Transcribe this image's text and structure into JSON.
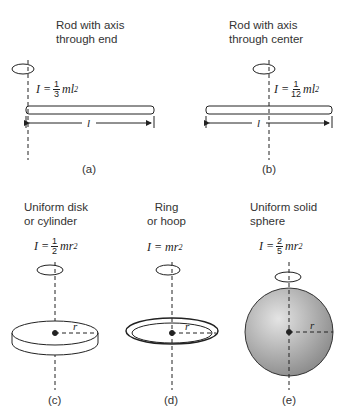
{
  "panels": [
    {
      "id": "a",
      "title_line1": "Rod with axis",
      "title_line2": "through end",
      "formula_lhs": "I =",
      "frac_num": "1",
      "frac_den": "3",
      "formula_rhs": "ml",
      "exp": "2",
      "length_label": "l",
      "caption": "(a)"
    },
    {
      "id": "b",
      "title_line1": "Rod with axis",
      "title_line2": "through center",
      "formula_lhs": "I =",
      "frac_num": "1",
      "frac_den": "12",
      "formula_rhs": "ml",
      "exp": "2",
      "length_label": "l",
      "caption": "(b)"
    },
    {
      "id": "c",
      "title_line1": "Uniform disk",
      "title_line2": "or cylinder",
      "formula_lhs": "I =",
      "frac_num": "1",
      "frac_den": "2",
      "formula_rhs": "mr",
      "exp": "2",
      "radius_label": "r",
      "caption": "(c)"
    },
    {
      "id": "d",
      "title_line1": "Ring",
      "title_line2": "or hoop",
      "formula_lhs": "I = mr",
      "exp": "2",
      "radius_label": "r",
      "caption": "(d)"
    },
    {
      "id": "e",
      "title_line1": "Uniform solid",
      "title_line2": "sphere",
      "formula_lhs": "I =",
      "frac_num": "2",
      "frac_den": "5",
      "formula_rhs": "mr",
      "exp": "2",
      "radius_label": "r",
      "caption": "(e)"
    }
  ],
  "colors": {
    "line": "#222222",
    "sphere_light": "#e0e0e0",
    "sphere_dark": "#8a8a8a"
  }
}
